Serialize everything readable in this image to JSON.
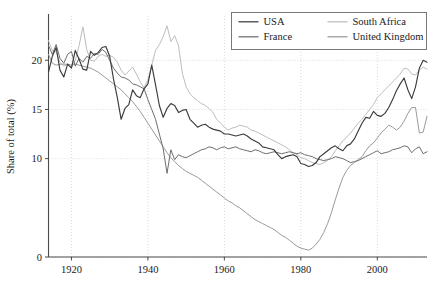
{
  "chart_data": {
    "type": "line",
    "title": "",
    "xlabel": "",
    "ylabel": "Share of total (%)",
    "xlim": [
      1914,
      2013
    ],
    "ylim": [
      0,
      24.5
    ],
    "xticks": [
      1920,
      1940,
      1960,
      1980,
      2000
    ],
    "yticks": [
      0,
      10,
      15,
      20
    ],
    "grid": true,
    "legend_position": "top-right",
    "colors": {
      "usa": "#3b3b3b",
      "france": "#6e6e6e",
      "south_africa": "#bdbdbd",
      "united_kingdom": "#9a9a9a",
      "grid": "#cfcfcf",
      "axis": "#4a4a4a"
    },
    "series": [
      {
        "name": "USA",
        "color_key": "usa",
        "x": [
          1914,
          1915,
          1916,
          1917,
          1918,
          1919,
          1920,
          1921,
          1922,
          1923,
          1924,
          1925,
          1926,
          1927,
          1928,
          1929,
          1930,
          1931,
          1932,
          1933,
          1934,
          1935,
          1936,
          1937,
          1938,
          1939,
          1940,
          1941,
          1942,
          1943,
          1944,
          1945,
          1946,
          1947,
          1948,
          1949,
          1950,
          1951,
          1952,
          1953,
          1954,
          1955,
          1956,
          1957,
          1958,
          1959,
          1960,
          1961,
          1962,
          1963,
          1964,
          1965,
          1966,
          1967,
          1968,
          1969,
          1970,
          1971,
          1972,
          1973,
          1974,
          1975,
          1976,
          1977,
          1978,
          1979,
          1980,
          1981,
          1982,
          1983,
          1984,
          1985,
          1986,
          1987,
          1988,
          1989,
          1990,
          1991,
          1992,
          1993,
          1994,
          1995,
          1996,
          1997,
          1998,
          1999,
          2000,
          2001,
          2002,
          2003,
          2004,
          2005,
          2006,
          2007,
          2008,
          2009,
          2010,
          2011,
          2012,
          2013
        ],
        "y": [
          18.8,
          20.4,
          21.3,
          19.0,
          18.3,
          19.6,
          19.2,
          21.0,
          20.1,
          19.1,
          19.0,
          20.9,
          20.5,
          20.8,
          21.3,
          21.4,
          20.4,
          18.1,
          16.2,
          14.0,
          15.1,
          15.5,
          17.0,
          16.4,
          16.2,
          17.1,
          17.6,
          19.5,
          17.5,
          15.4,
          14.2,
          15.1,
          15.6,
          15.4,
          14.7,
          14.9,
          15.0,
          14.0,
          13.6,
          13.2,
          13.4,
          13.5,
          13.2,
          13.0,
          12.9,
          12.8,
          12.5,
          12.5,
          12.4,
          12.3,
          12.4,
          12.5,
          12.3,
          12.0,
          11.8,
          11.6,
          11.2,
          11.1,
          11.0,
          10.9,
          10.4,
          10.0,
          10.2,
          10.3,
          10.4,
          10.2,
          9.5,
          9.4,
          9.2,
          9.3,
          9.6,
          10.2,
          10.5,
          10.8,
          11.1,
          11.3,
          11.0,
          10.8,
          11.3,
          11.5,
          12.0,
          12.8,
          13.6,
          14.2,
          14.1,
          14.8,
          14.4,
          14.3,
          14.6,
          15.2,
          16.0,
          16.9,
          17.6,
          18.2,
          17.0,
          16.1,
          17.3,
          19.2,
          20.0,
          19.8
        ]
      },
      {
        "name": "France",
        "color_key": "france",
        "x": [
          1914,
          1915,
          1916,
          1917,
          1918,
          1919,
          1920,
          1921,
          1922,
          1923,
          1924,
          1925,
          1926,
          1927,
          1928,
          1929,
          1930,
          1931,
          1932,
          1933,
          1934,
          1935,
          1936,
          1937,
          1938,
          1939,
          1940,
          1941,
          1942,
          1943,
          1944,
          1945,
          1946,
          1947,
          1948,
          1949,
          1950,
          1951,
          1952,
          1953,
          1954,
          1955,
          1956,
          1957,
          1958,
          1959,
          1960,
          1961,
          1962,
          1963,
          1964,
          1965,
          1966,
          1967,
          1968,
          1969,
          1970,
          1971,
          1972,
          1973,
          1974,
          1975,
          1976,
          1977,
          1978,
          1979,
          1980,
          1981,
          1982,
          1983,
          1984,
          1985,
          1986,
          1987,
          1988,
          1989,
          1990,
          1991,
          1992,
          1993,
          1994,
          1995,
          1996,
          1997,
          1998,
          1999,
          2000,
          2001,
          2002,
          2003,
          2004,
          2005,
          2006,
          2007,
          2008,
          2009,
          2010,
          2011,
          2012,
          2013
        ],
        "y": [
          21.5,
          20.6,
          21.6,
          20.2,
          19.7,
          20.6,
          20.9,
          19.4,
          20.2,
          19.8,
          20.4,
          20.2,
          20.7,
          20.6,
          21.1,
          20.8,
          20.0,
          19.2,
          18.7,
          18.3,
          18.2,
          18.0,
          17.6,
          17.5,
          17.3,
          17.1,
          16.0,
          15.0,
          14.0,
          12.5,
          11.0,
          8.5,
          10.9,
          9.9,
          10.4,
          10.2,
          10.1,
          10.3,
          10.5,
          10.7,
          10.9,
          11.0,
          11.2,
          11.1,
          10.9,
          11.1,
          11.2,
          11.0,
          11.1,
          11.2,
          11.0,
          10.9,
          10.8,
          10.7,
          10.9,
          10.8,
          10.6,
          10.5,
          10.6,
          10.7,
          10.6,
          10.5,
          10.6,
          10.7,
          10.6,
          10.5,
          10.6,
          10.4,
          10.3,
          10.2,
          10.0,
          9.9,
          9.8,
          9.9,
          10.0,
          10.2,
          10.1,
          10.0,
          9.8,
          9.6,
          9.7,
          9.8,
          10.0,
          10.2,
          10.4,
          10.6,
          10.8,
          10.5,
          10.6,
          10.7,
          10.9,
          11.0,
          11.1,
          11.3,
          11.2,
          10.6,
          11.0,
          11.2,
          10.5,
          10.7
        ]
      },
      {
        "name": "South Africa",
        "color_key": "south_africa",
        "x": [
          1914,
          1915,
          1916,
          1917,
          1918,
          1919,
          1920,
          1921,
          1922,
          1923,
          1924,
          1925,
          1926,
          1927,
          1928,
          1929,
          1930,
          1931,
          1932,
          1933,
          1934,
          1935,
          1936,
          1937,
          1938,
          1939,
          1940,
          1941,
          1942,
          1943,
          1944,
          1945,
          1946,
          1947,
          1948,
          1949,
          1950,
          1951,
          1952,
          1953,
          1954,
          1955,
          1956,
          1957,
          1958,
          1959,
          1960,
          1961,
          1962,
          1963,
          1964,
          1965,
          1966,
          1967,
          1968,
          1969,
          1970,
          1971,
          1972,
          1973,
          1974,
          1975,
          1976,
          1977,
          1978,
          1979,
          1980,
          1981,
          1982,
          1983,
          1984,
          1985,
          1986,
          1987,
          1988,
          1989,
          1990,
          1991,
          1992,
          1993,
          1994,
          1995,
          1996,
          1997,
          1998,
          1999,
          2000,
          2001,
          2002,
          2003,
          2004,
          2005,
          2006,
          2007,
          2008,
          2009,
          2010,
          2011,
          2012,
          2013
        ],
        "y": [
          22.0,
          21.0,
          20.9,
          19.8,
          19.4,
          19.6,
          19.3,
          20.0,
          21.5,
          23.4,
          21.1,
          20.0,
          19.9,
          20.4,
          20.6,
          20.4,
          20.5,
          20.3,
          19.8,
          19.0,
          18.5,
          18.9,
          19.3,
          18.6,
          17.8,
          17.2,
          18.0,
          19.5,
          21.0,
          21.6,
          22.4,
          23.5,
          21.9,
          22.5,
          21.5,
          18.7,
          17.3,
          16.6,
          16.2,
          15.9,
          15.6,
          15.4,
          15.1,
          14.7,
          14.0,
          13.6,
          13.2,
          12.9,
          13.1,
          13.2,
          13.4,
          13.3,
          13.2,
          12.9,
          12.8,
          12.6,
          12.4,
          12.2,
          12.0,
          11.8,
          11.6,
          11.4,
          11.2,
          10.9,
          10.6,
          10.4,
          10.1,
          10.0,
          9.8,
          9.6,
          9.5,
          9.4,
          9.6,
          9.8,
          10.2,
          10.8,
          11.3,
          11.8,
          12.2,
          12.6,
          13.1,
          13.6,
          14.0,
          14.5,
          15.0,
          15.5,
          16.2,
          16.6,
          17.0,
          17.4,
          17.8,
          18.2,
          18.6,
          19.2,
          19.1,
          18.6,
          18.5,
          19.0,
          19.3,
          19.1
        ]
      },
      {
        "name": "United Kingdom",
        "color_key": "united_kingdom",
        "x": [
          1914,
          1915,
          1916,
          1917,
          1918,
          1919,
          1920,
          1921,
          1922,
          1923,
          1924,
          1925,
          1926,
          1927,
          1928,
          1929,
          1930,
          1931,
          1932,
          1933,
          1934,
          1935,
          1936,
          1937,
          1938,
          1939,
          1940,
          1941,
          1942,
          1943,
          1944,
          1945,
          1946,
          1947,
          1948,
          1949,
          1950,
          1951,
          1952,
          1953,
          1954,
          1955,
          1956,
          1957,
          1958,
          1959,
          1960,
          1961,
          1962,
          1963,
          1964,
          1965,
          1966,
          1967,
          1968,
          1969,
          1970,
          1971,
          1972,
          1973,
          1974,
          1975,
          1976,
          1977,
          1978,
          1979,
          1980,
          1981,
          1982,
          1983,
          1984,
          1985,
          1986,
          1987,
          1988,
          1989,
          1990,
          1991,
          1992,
          1993,
          1994,
          1995,
          1996,
          1997,
          1998,
          1999,
          2000,
          2001,
          2002,
          2003,
          2004,
          2005,
          2006,
          2007,
          2008,
          2009,
          2010,
          2011,
          2012,
          2013
        ],
        "y": [
          20.6,
          19.7,
          19.5,
          19.6,
          19.6,
          19.6,
          19.5,
          19.6,
          19.5,
          19.4,
          19.3,
          19.2,
          19.0,
          18.8,
          18.5,
          18.2,
          17.9,
          17.6,
          17.3,
          17.0,
          16.6,
          16.2,
          15.8,
          15.3,
          14.8,
          14.2,
          13.6,
          13.0,
          12.4,
          11.8,
          11.2,
          10.6,
          10.1,
          9.7,
          9.3,
          9.0,
          8.7,
          8.5,
          8.3,
          8.1,
          7.8,
          7.5,
          7.2,
          6.9,
          6.6,
          6.3,
          6.0,
          5.7,
          5.5,
          5.2,
          5.0,
          4.7,
          4.4,
          4.1,
          3.8,
          3.6,
          3.4,
          3.2,
          3.0,
          2.8,
          2.5,
          2.2,
          2.0,
          1.7,
          1.4,
          1.1,
          0.9,
          0.8,
          0.7,
          0.9,
          1.3,
          1.8,
          2.5,
          3.4,
          4.5,
          5.8,
          7.0,
          8.1,
          8.8,
          9.3,
          9.6,
          9.9,
          10.2,
          10.8,
          11.3,
          11.6,
          12.1,
          12.6,
          13.0,
          13.4,
          13.2,
          12.9,
          13.2,
          13.8,
          14.6,
          15.2,
          15.2,
          12.6,
          12.7,
          14.3
        ]
      }
    ]
  },
  "legend": {
    "items": [
      {
        "label": "USA",
        "color_key": "usa"
      },
      {
        "label": "South Africa",
        "color_key": "south_africa"
      },
      {
        "label": "France",
        "color_key": "france"
      },
      {
        "label": "United Kingdom",
        "color_key": "united_kingdom"
      }
    ]
  },
  "axes": {
    "ylabel": "Share of total (%)",
    "ytick_labels": [
      "0",
      "10",
      "15",
      "20"
    ],
    "xtick_labels": [
      "1920",
      "1940",
      "1960",
      "1980",
      "2000"
    ]
  }
}
